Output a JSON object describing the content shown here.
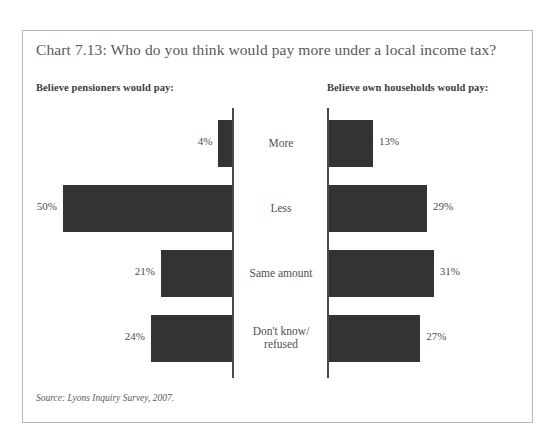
{
  "chart": {
    "title": "Chart 7.13: Who do you think would pay more under a local income tax?",
    "left_panel_heading": "Believe pensioners would pay:",
    "right_panel_heading": "Believe own households would pay:",
    "source_note": "Source: Lyons Inquiry Survey, 2007.",
    "colors": {
      "bar_fill": "#333335",
      "axis_line": "#4a4a4d",
      "frame_border": "#b9b9bb",
      "title_text": "#58585c",
      "label_text": "#4f4f53"
    }
  },
  "chart_data": {
    "type": "bar",
    "orientation": "horizontal",
    "layout": "back-to-back diverging pair",
    "title": "Chart 7.13: Who do you think would pay more under a local income tax?",
    "xlabel": "",
    "ylabel": "",
    "grid": false,
    "legend_position": "none",
    "axis_max_percent": 50,
    "value_suffix": "%",
    "categories": [
      "More",
      "Less",
      "Same amount",
      "Don't know/ refused"
    ],
    "series": [
      {
        "name": "Believe pensioners would pay:",
        "side": "left",
        "values": [
          4,
          50,
          21,
          24
        ],
        "labels": [
          "4%",
          "50%",
          "21%",
          "24%"
        ]
      },
      {
        "name": "Believe own households would pay:",
        "side": "right",
        "values": [
          13,
          29,
          31,
          27
        ],
        "labels": [
          "13%",
          "29%",
          "31%",
          "27%"
        ]
      }
    ],
    "annotations": [
      "Source: Lyons Inquiry Survey, 2007."
    ]
  }
}
